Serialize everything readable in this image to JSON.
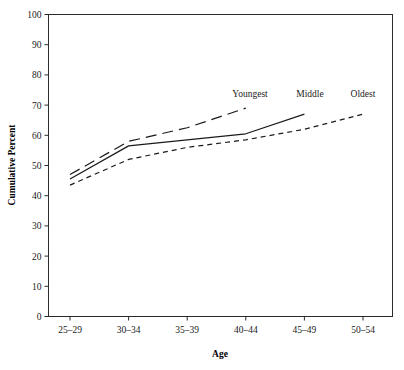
{
  "chart_data": {
    "type": "line",
    "title": "",
    "subtitle": "",
    "xlabel": "Age",
    "ylabel": "Cumulative Percent",
    "categories": [
      "25–29",
      "30–34",
      "35–39",
      "40–44",
      "45–49",
      "50–54"
    ],
    "ylim": [
      0,
      100
    ],
    "yticks": [
      0,
      10,
      20,
      30,
      40,
      50,
      60,
      70,
      80,
      90,
      100
    ],
    "ytick_labels": [
      "0",
      "10",
      "20",
      "30",
      "40",
      "50",
      "60",
      "70",
      "80",
      "90",
      "100"
    ],
    "grid": false,
    "legend_position": "inline-end-of-line",
    "series": [
      {
        "name": "Youngest",
        "style": "long-dash",
        "label": "Youngest",
        "x": [
          "25–29",
          "30–34",
          "35–39",
          "40–44"
        ],
        "values": [
          47,
          58,
          62.5,
          69
        ]
      },
      {
        "name": "Middle",
        "style": "solid",
        "label": "Middle",
        "x": [
          "25–29",
          "30–34",
          "35–39",
          "40–44",
          "45–49"
        ],
        "values": [
          45.5,
          56.5,
          58.5,
          60.5,
          67
        ]
      },
      {
        "name": "Oldest",
        "style": "short-dash",
        "label": "Oldest",
        "x": [
          "25–29",
          "30–34",
          "35–39",
          "40–44",
          "45–49",
          "50–54"
        ],
        "values": [
          43.5,
          52,
          56,
          58.5,
          62,
          67
        ]
      }
    ],
    "annotations": [
      {
        "text": "Youngest",
        "x": 250,
        "y": 97
      },
      {
        "text": "Middle",
        "x": 310,
        "y": 97
      },
      {
        "text": "Oldest",
        "x": 363,
        "y": 97
      }
    ]
  },
  "axis": {
    "x_label": "Age",
    "y_label": "Cumulative Percent"
  }
}
